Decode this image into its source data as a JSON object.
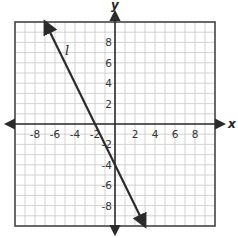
{
  "chart_data": {
    "type": "line",
    "title": "",
    "xlabel": "x",
    "ylabel": "y",
    "xlim": [
      -10,
      10
    ],
    "ylim": [
      -10,
      10
    ],
    "grid": true,
    "grid_step": 1,
    "x_ticks": [
      -8,
      -6,
      -4,
      -2,
      2,
      4,
      6,
      8
    ],
    "x_tick_labels": [
      "-8",
      "-6",
      "-4",
      "-2",
      "2",
      "4",
      "6",
      "8"
    ],
    "y_ticks": [
      8,
      6,
      4,
      2,
      -2,
      -4,
      -6,
      -8
    ],
    "y_tick_labels": [
      "8",
      "6",
      "4",
      "2",
      "-2",
      "-4",
      "-6",
      "-8"
    ],
    "series": [
      {
        "name": "l",
        "label": "l",
        "equation": "y = -2x - 4",
        "slope": -2,
        "y_intercept": -4,
        "x_intercept": -2,
        "points": [
          [
            -7,
            10
          ],
          [
            -2,
            0
          ],
          [
            0,
            -4
          ],
          [
            3,
            -10
          ]
        ],
        "arrows_both_ends": true,
        "color": "#2b2b2b"
      }
    ],
    "legend": "none"
  },
  "colors": {
    "grid": "#c8c8c8",
    "border": "#444444",
    "axis": "#2b2b2b"
  }
}
